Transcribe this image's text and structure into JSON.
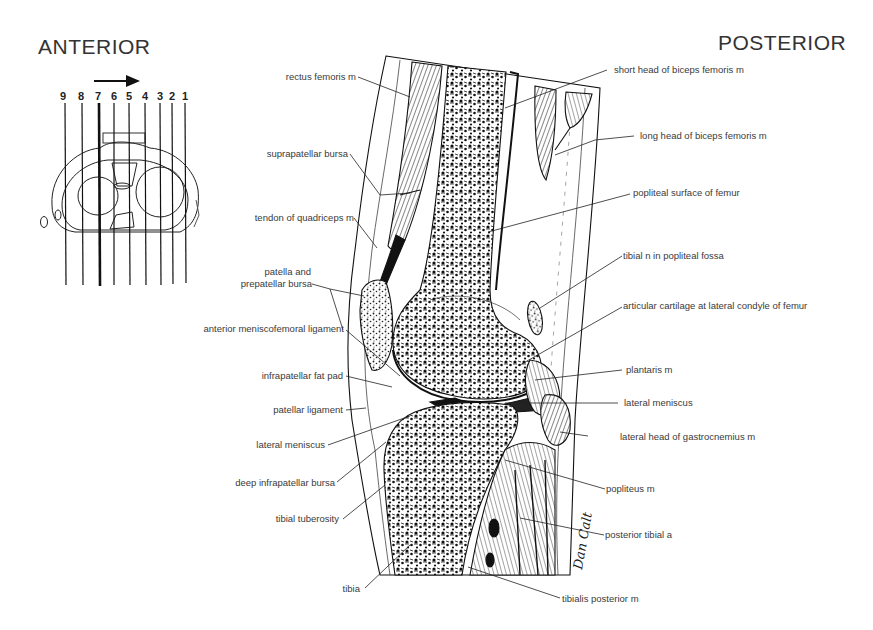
{
  "headings": {
    "anterior": "ANTERIOR",
    "posterior": "POSTERIOR"
  },
  "section_key": {
    "numbers": [
      "9",
      "8",
      "7",
      "6",
      "5",
      "4",
      "3",
      "2",
      "1"
    ],
    "highlighted_section": "7",
    "arrow_direction": "right"
  },
  "labels_left": [
    "rectus femoris m",
    "suprapatellar bursa",
    "tendon of quadriceps m",
    "patella and",
    "prepatellar bursa",
    "anterior meniscofemoral ligament",
    "infrapatellar fat pad",
    "patellar ligament",
    "lateral meniscus",
    "deep infrapatellar bursa",
    "tibial tuberosity",
    "tibia"
  ],
  "labels_right": [
    "short head of biceps femoris m",
    "long head of biceps femoris m",
    "popliteal surface of femur",
    "tibial n in popliteal fossa",
    "articular cartilage at lateral condyle of femur",
    "plantaris m",
    "lateral meniscus",
    "lateral head of gastrocnemius m",
    "popliteus m",
    "posterior tibial a",
    "tibialis posterior m"
  ],
  "signature": "Dan Calt"
}
